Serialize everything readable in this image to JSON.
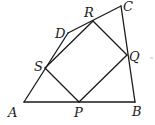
{
  "diagram": {
    "type": "geometry",
    "points": {
      "A": {
        "x": 24,
        "y": 102
      },
      "B": {
        "x": 135,
        "y": 102
      },
      "C": {
        "x": 121,
        "y": 6
      },
      "D": {
        "x": 68,
        "y": 33
      },
      "P": {
        "x": 79,
        "y": 102
      },
      "Q": {
        "x": 127,
        "y": 55
      },
      "R": {
        "x": 93,
        "y": 21
      },
      "S": {
        "x": 45,
        "y": 68
      }
    },
    "outer_quadrilateral": [
      "A",
      "B",
      "C",
      "D"
    ],
    "inner_quadrilateral": [
      "P",
      "Q",
      "R",
      "S"
    ],
    "labels": [
      {
        "id": "A",
        "text": "A",
        "x": 8,
        "y": 117
      },
      {
        "id": "B",
        "text": "B",
        "x": 132,
        "y": 116
      },
      {
        "id": "C",
        "text": "C",
        "x": 123,
        "y": 11
      },
      {
        "id": "D",
        "text": "D",
        "x": 55,
        "y": 38
      },
      {
        "id": "P",
        "text": "P",
        "x": 74,
        "y": 117
      },
      {
        "id": "Q",
        "text": "Q",
        "x": 129,
        "y": 61
      },
      {
        "id": "R",
        "text": "R",
        "x": 84,
        "y": 17
      },
      {
        "id": "S",
        "text": "S",
        "x": 34,
        "y": 71
      }
    ]
  }
}
